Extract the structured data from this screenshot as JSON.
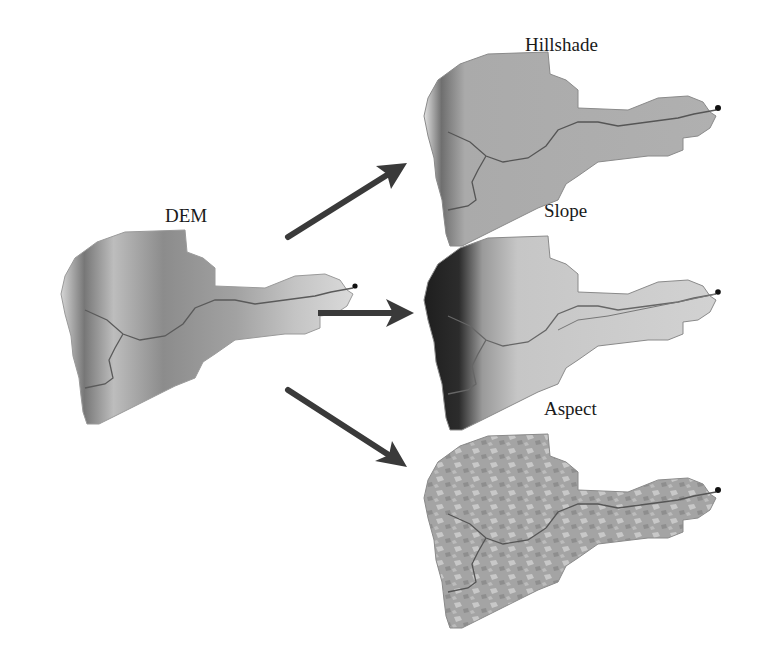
{
  "diagram": {
    "type": "flow",
    "source": {
      "label": "DEM",
      "fill": "#9c9c9c"
    },
    "outputs": [
      {
        "label": "Hillshade",
        "fill": "#a9a9a9"
      },
      {
        "label": "Slope",
        "fill": "#c4c4c4"
      },
      {
        "label": "Aspect",
        "fill": "#a6a6a6"
      }
    ],
    "edges": [
      {
        "from": "DEM",
        "to": "Hillshade",
        "direction": "up-right"
      },
      {
        "from": "DEM",
        "to": "Slope",
        "direction": "right"
      },
      {
        "from": "DEM",
        "to": "Aspect",
        "direction": "down-right"
      }
    ],
    "colors": {
      "arrow": "#3a3a3a",
      "stream": "#555555",
      "outlet": "#111111",
      "background": "#ffffff"
    }
  }
}
